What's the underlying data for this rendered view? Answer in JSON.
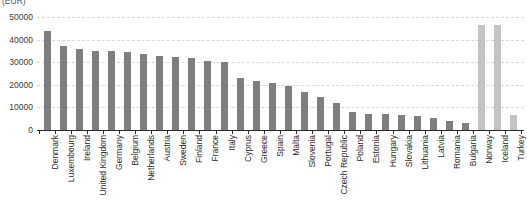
{
  "chart_data": {
    "type": "bar",
    "title": "",
    "unit_label": "(EUR)",
    "xlabel": "",
    "ylabel": "",
    "ylim": [
      0,
      50000
    ],
    "ytick_labels": [
      "0",
      "10000",
      "20000",
      "30000",
      "40000",
      "50000"
    ],
    "ytick_values": [
      0,
      10000,
      20000,
      30000,
      40000,
      50000
    ],
    "grid": true,
    "legend": "none",
    "categories": [
      "Denmark",
      "Luxembourg",
      "Ireland",
      "United Kingdom",
      "Germany",
      "Belgium",
      "Netherlands",
      "Austria",
      "Sweden",
      "Finland",
      "France",
      "Italy",
      "Cyprus",
      "Greece",
      "Spain",
      "Malta",
      "Slovenia",
      "Portugal",
      "Czech Republic",
      "Poland",
      "Estonia",
      "Hungary",
      "Slovakia",
      "Lithuania",
      "Latvia",
      "Romania",
      "Bulgaria",
      "Norway",
      "Iceland",
      "Turkey"
    ],
    "values": [
      44000,
      37000,
      36000,
      35000,
      34800,
      34500,
      33500,
      32800,
      32500,
      32000,
      30500,
      30000,
      23000,
      21500,
      21000,
      19500,
      17000,
      14500,
      12000,
      7800,
      7200,
      7000,
      6800,
      6000,
      5500,
      4200,
      3000,
      46500,
      46500,
      6500
    ],
    "bar_colors": [
      "#7e7e7e",
      "#7e7e7e",
      "#7e7e7e",
      "#7e7e7e",
      "#7e7e7e",
      "#7e7e7e",
      "#7e7e7e",
      "#7e7e7e",
      "#7e7e7e",
      "#7e7e7e",
      "#7e7e7e",
      "#7e7e7e",
      "#7e7e7e",
      "#7e7e7e",
      "#7e7e7e",
      "#7e7e7e",
      "#7e7e7e",
      "#7e7e7e",
      "#7e7e7e",
      "#7e7e7e",
      "#7e7e7e",
      "#7e7e7e",
      "#7e7e7e",
      "#7e7e7e",
      "#7e7e7e",
      "#7e7e7e",
      "#7e7e7e",
      "#c3c3c3",
      "#c3c3c3",
      "#c3c3c3"
    ],
    "colors": {
      "bar_eu": "#7e7e7e",
      "bar_non_eu": "#c3c3c3",
      "gridline": "#d8d8e2",
      "axis": "#2b2b2b",
      "text": "#2b2b2b",
      "background": "#ffffff"
    }
  }
}
